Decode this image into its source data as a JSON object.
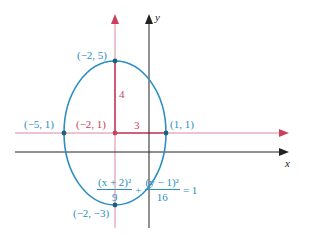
{
  "diagram": {
    "axes": {
      "x_label": "x",
      "y_label": "y"
    },
    "ellipse": {
      "center_label": "(−2, 1)",
      "top_label": "(−2, 5)",
      "bottom_label": "(−2, −3)",
      "left_label": "(−5, 1)",
      "right_label": "(1, 1)",
      "semi_major_label": "4",
      "semi_minor_label": "3"
    },
    "equation": {
      "term1_num": "(x + 2)²",
      "term1_den": "9",
      "plus": "+",
      "term2_num": "(y − 1)²",
      "term2_den": "16",
      "rhs": "= 1"
    },
    "colors": {
      "ellipse": "#2a8fbf",
      "shifted_axes": "#c9415e",
      "axes": "#222222"
    }
  }
}
